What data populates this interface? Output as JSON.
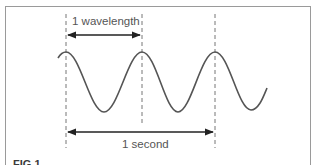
{
  "diagram": {
    "title_labels": {
      "wavelength": "1 wavelength",
      "period": "1 second"
    },
    "figure_label": "FIG 1",
    "colors": {
      "wave": "#555555",
      "dashes": "#777777",
      "arrows": "#222222",
      "text": "#555555",
      "frame": "#9a9a9a"
    },
    "wave": {
      "cycles_shown": 3,
      "peaks_x": [
        66,
        142,
        215
      ],
      "peak_y": 52,
      "trough_y": 112
    },
    "markers": {
      "dashed_lines_x": [
        66,
        142,
        215
      ]
    }
  }
}
